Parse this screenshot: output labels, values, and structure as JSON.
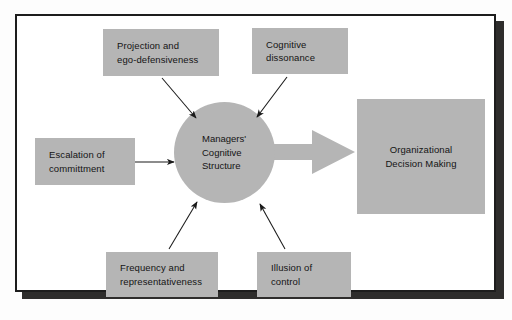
{
  "diagram": {
    "style": {
      "node_fill": "#b5b5b5",
      "frame_border": "#1d1d1d",
      "shadow": "#2e2d2c",
      "text_color": "#141414",
      "connector_color": "#1a1a1a",
      "page_background": "#ffffff"
    },
    "center_node": {
      "shape": "circle",
      "lines": [
        "Managers'",
        "Cognitive",
        "Structure"
      ]
    },
    "outcome_node": {
      "shape": "rectangle",
      "lines": [
        "Organizational",
        "Decision Making"
      ]
    },
    "input_nodes": [
      {
        "id": "projection",
        "lines": [
          "Projection and",
          "ego-defensiveness"
        ],
        "position": "top-left"
      },
      {
        "id": "dissonance",
        "lines": [
          "Cognitive",
          "dissonance"
        ],
        "position": "top-right"
      },
      {
        "id": "escalation",
        "lines": [
          "Escalation of",
          "committment"
        ],
        "position": "left"
      },
      {
        "id": "frequency",
        "lines": [
          "Frequency and",
          "representativeness"
        ],
        "position": "bottom-left"
      },
      {
        "id": "illusion",
        "lines": [
          "Illusion of",
          "control"
        ],
        "position": "bottom-right"
      }
    ],
    "connectors": [
      {
        "from": "projection",
        "to": "center_node",
        "kind": "thin-arrow",
        "direction": "down-right"
      },
      {
        "from": "dissonance",
        "to": "center_node",
        "kind": "thin-arrow",
        "direction": "down-left"
      },
      {
        "from": "escalation",
        "to": "center_node",
        "kind": "thin-arrow",
        "direction": "right"
      },
      {
        "from": "frequency",
        "to": "center_node",
        "kind": "thin-arrow",
        "direction": "up-right"
      },
      {
        "from": "illusion",
        "to": "center_node",
        "kind": "thin-arrow",
        "direction": "up-left"
      },
      {
        "from": "center_node",
        "to": "outcome_node",
        "kind": "block-arrow",
        "direction": "right"
      }
    ]
  }
}
